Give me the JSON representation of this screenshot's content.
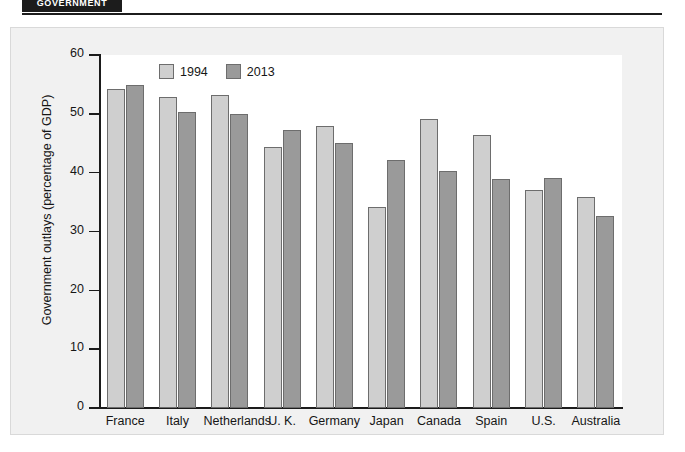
{
  "header": {
    "tab_label": "GOVERNMENT"
  },
  "legend": {
    "items": [
      {
        "label": "1994",
        "color": "#cfcfcf",
        "key": "y1994"
      },
      {
        "label": "2013",
        "color": "#9a9a9a",
        "key": "y2013"
      }
    ]
  },
  "axis": {
    "y_title": "Government outlays (percentage of GDP)",
    "y_ticks": [
      "0",
      "10",
      "20",
      "30",
      "40",
      "50",
      "60"
    ]
  },
  "chart_data": {
    "type": "bar",
    "title": "",
    "xlabel": "",
    "ylabel": "Government outlays (percentage of GDP)",
    "ylim": [
      0,
      60
    ],
    "ytick_values": [
      0,
      10,
      20,
      30,
      40,
      50,
      60
    ],
    "grid": false,
    "legend_position": "top-left-inside",
    "categories": [
      "France",
      "Italy",
      "Netherlands",
      "U. K.",
      "Germany",
      "Japan",
      "Canada",
      "Spain",
      "U.S.",
      "Australia"
    ],
    "series": [
      {
        "name": "1994",
        "color": "#cfcfcf",
        "values": [
          54.2,
          52.9,
          53.2,
          44.4,
          48.0,
          34.2,
          49.2,
          46.4,
          37.0,
          35.8
        ]
      },
      {
        "name": "2013",
        "color": "#9a9a9a",
        "values": [
          54.9,
          50.3,
          50.0,
          47.2,
          45.0,
          42.2,
          40.2,
          39.0,
          39.1,
          32.7
        ]
      }
    ]
  }
}
